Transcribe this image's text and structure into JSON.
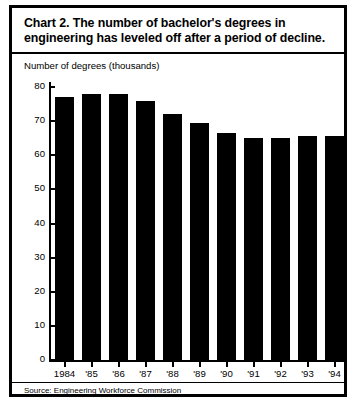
{
  "figure": {
    "title": "Chart 2.  The number of bachelor's degrees in engineering has leveled off after a period of decline.",
    "ylabel": "Number of degrees (thousands)",
    "source": "Source:  Engineering Workforce Commission"
  },
  "chart_data": {
    "type": "bar",
    "title": "Chart 2.  The number of bachelor's degrees in engineering has leveled off after a period of decline.",
    "xlabel": "",
    "ylabel": "Number of degrees (thousands)",
    "categories": [
      "1984",
      "'85",
      "'86",
      "'87",
      "'88",
      "'89",
      "'90",
      "'91",
      "'92",
      "'93",
      "'94"
    ],
    "values": [
      77,
      78,
      78,
      76,
      72,
      69.5,
      66.5,
      65,
      65,
      65.5,
      65.5
    ],
    "ylim": [
      0,
      80
    ],
    "yticks": [
      0,
      10,
      20,
      30,
      40,
      50,
      60,
      70,
      80
    ],
    "ytick_labels": [
      "0",
      "10",
      "20",
      "30",
      "40",
      "50",
      "60",
      "70",
      "80"
    ],
    "grid": false,
    "legend": false,
    "bar_color": "#000000",
    "background": "#ffffff",
    "source": "Source:  Engineering Workforce Commission"
  }
}
